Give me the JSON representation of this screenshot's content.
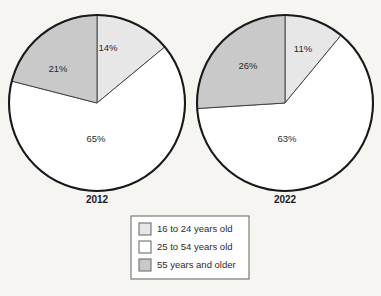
{
  "chart_data": {
    "type": "pie",
    "title": "",
    "subtitle": "",
    "xlabel": "",
    "ylabel": "",
    "legend_position": "bottom-center",
    "grid": false,
    "categories": [
      "16 to 24 years old",
      "25 to 54 years old",
      "55 years and older"
    ],
    "colors": [
      "#e7e7e7",
      "#ffffff",
      "#c9c9c9"
    ],
    "charts": [
      {
        "name": "2012",
        "label": "2012",
        "slices": [
          {
            "category": "16 to 24 years old",
            "value": 14,
            "label": "14%"
          },
          {
            "category": "25 to 54 years old",
            "value": 65,
            "label": "65%"
          },
          {
            "category": "55 years and older",
            "value": 21,
            "label": "21%"
          }
        ]
      },
      {
        "name": "2022",
        "label": "2022",
        "slices": [
          {
            "category": "16 to 24 years old",
            "value": 11,
            "label": "11%"
          },
          {
            "category": "25 to 54 years old",
            "value": 63,
            "label": "63%"
          },
          {
            "category": "55 years and older",
            "value": 26,
            "label": "26%"
          }
        ]
      }
    ]
  },
  "pies": {
    "left": {
      "year": "2012",
      "pct_young": "14%",
      "pct_mid": "65%",
      "pct_old": "21%"
    },
    "right": {
      "year": "2022",
      "pct_young": "11%",
      "pct_mid": "63%",
      "pct_old": "26%"
    }
  },
  "legend": {
    "items": [
      {
        "label": "16 to 24 years old",
        "color": "#e7e7e7"
      },
      {
        "label": "25 to 54 years old",
        "color": "#ffffff"
      },
      {
        "label": "55 years and older",
        "color": "#c9c9c9"
      }
    ]
  }
}
